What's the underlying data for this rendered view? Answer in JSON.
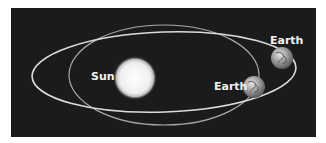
{
  "diagram": {
    "labels": {
      "sun": "Sun",
      "earth_upper": "Earth",
      "earth_lower": "Earth"
    },
    "colors": {
      "background": "#1b1b1b",
      "orbit": "#d8d8d8",
      "sun": "#f4f4f4",
      "label": "#f2f2f2"
    }
  }
}
